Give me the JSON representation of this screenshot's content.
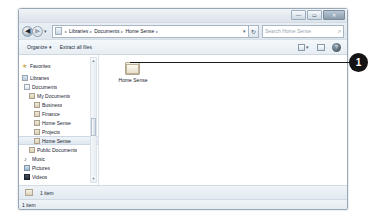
{
  "window": {
    "controls": {
      "minimize": "—",
      "maximize": "▭",
      "close": "✕"
    }
  },
  "address_bar": {
    "back_glyph": "◀",
    "forward_glyph": "▶",
    "history_caret": "▾",
    "breadcrumb": [
      {
        "label": "Libraries",
        "sep": "▸"
      },
      {
        "label": "Documents",
        "sep": "▸"
      },
      {
        "label": "Home Sense",
        "sep": "▸"
      }
    ],
    "breadcrumb_caret": "▾",
    "refresh_glyph": "↻",
    "search_placeholder": "Search Home Sense",
    "search_icon": "search-icon",
    "search_glyph": "⌕"
  },
  "toolbar": {
    "organize_label": "Organize ▾",
    "extract_label": "Extract all files",
    "view_caret": "▾",
    "help_glyph": "?"
  },
  "nav_pane": {
    "items": [
      {
        "label": "Favorites",
        "icon": "star-icon",
        "indent": 0,
        "selected": false,
        "kind": "star"
      },
      {
        "label": "Libraries",
        "icon": "library-icon",
        "indent": 0,
        "selected": false,
        "kind": "lib"
      },
      {
        "label": "Documents",
        "icon": "documents-library-icon",
        "indent": 1,
        "selected": false,
        "kind": "doc"
      },
      {
        "label": "My Documents",
        "icon": "folder-icon",
        "indent": 2,
        "selected": false,
        "kind": "folder"
      },
      {
        "label": "Business",
        "icon": "folder-icon",
        "indent": 3,
        "selected": false,
        "kind": "folder"
      },
      {
        "label": "Finance",
        "icon": "folder-icon",
        "indent": 3,
        "selected": false,
        "kind": "folder"
      },
      {
        "label": "Home Sense",
        "icon": "folder-icon",
        "indent": 3,
        "selected": false,
        "kind": "folder"
      },
      {
        "label": "Projects",
        "icon": "folder-icon",
        "indent": 3,
        "selected": false,
        "kind": "folder"
      },
      {
        "label": "Home Sense",
        "icon": "folder-icon",
        "indent": 3,
        "selected": true,
        "kind": "folder"
      },
      {
        "label": "Public Documents",
        "icon": "folder-icon",
        "indent": 2,
        "selected": false,
        "kind": "folder"
      },
      {
        "label": "Music",
        "icon": "music-icon",
        "indent": 1,
        "selected": false,
        "kind": "music"
      },
      {
        "label": "Pictures",
        "icon": "pictures-icon",
        "indent": 1,
        "selected": false,
        "kind": "pic"
      },
      {
        "label": "Videos",
        "icon": "videos-icon",
        "indent": 1,
        "selected": false,
        "kind": "vid"
      }
    ],
    "scrollbar": {
      "up_glyph": "▲",
      "down_glyph": "▼"
    }
  },
  "content": {
    "items": [
      {
        "label": "Home Sense",
        "icon": "folder-icon"
      }
    ]
  },
  "details_pane": {
    "text": "1 item",
    "icon": "folder-icon"
  },
  "status_bar": {
    "text": "1 item"
  },
  "callout": {
    "number": "1",
    "color": "#141414"
  }
}
